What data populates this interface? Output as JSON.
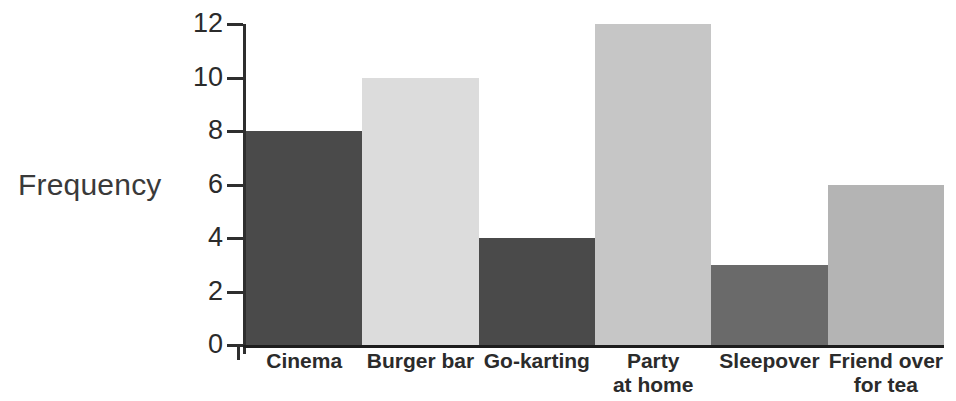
{
  "chart_data": {
    "type": "bar",
    "title": "",
    "xlabel": "",
    "ylabel": "Frequency",
    "categories": [
      "Cinema",
      "Burger bar",
      "Go-karting",
      "Party at home",
      "Sleepover",
      "Friend over for tea"
    ],
    "category_lines": [
      [
        "Cinema"
      ],
      [
        "Burger bar"
      ],
      [
        "Go-karting"
      ],
      [
        "Party",
        "at home"
      ],
      [
        "Sleepover"
      ],
      [
        "Friend over",
        "for tea"
      ]
    ],
    "values": [
      8,
      10,
      4,
      12,
      3,
      6
    ],
    "bar_colors": [
      "#4a4a4a",
      "#dcdcdc",
      "#4a4a4a",
      "#c6c6c6",
      "#6a6a6a",
      "#b4b4b4"
    ],
    "ylim": [
      0,
      12
    ],
    "ytick_values": [
      0,
      2,
      4,
      6,
      8,
      10,
      12
    ],
    "ytick_labels": [
      "0",
      "2",
      "4",
      "6",
      "8",
      "10",
      "12"
    ],
    "grid": false,
    "legend": "none",
    "axis_color": "#2e2e2e",
    "background": "#ffffff"
  }
}
